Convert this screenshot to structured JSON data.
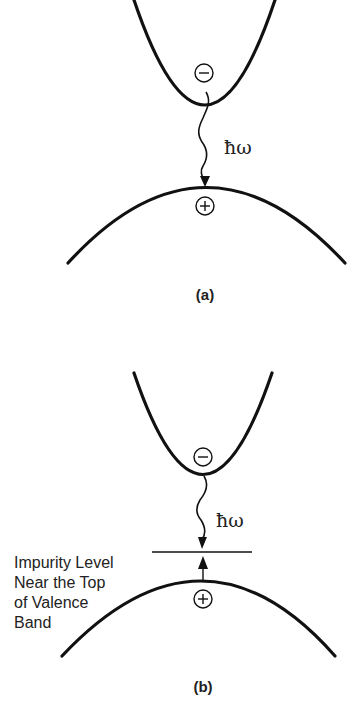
{
  "figure": {
    "panel_a": {
      "caption": "(a)",
      "photon_label": "ħω",
      "electron_symbol": "−",
      "hole_symbol": "+",
      "description": "Band-to-band radiative recombination: electron at conduction band minimum recombines with hole at valence band maximum emitting photon"
    },
    "panel_b": {
      "caption": "(b)",
      "photon_label": "ħω",
      "electron_symbol": "−",
      "hole_symbol": "+",
      "impurity_label_lines": [
        "Impurity Level",
        "Near the Top",
        "of Valence",
        "Band"
      ],
      "description": "Recombination via impurity level near the top of the valence band"
    }
  }
}
